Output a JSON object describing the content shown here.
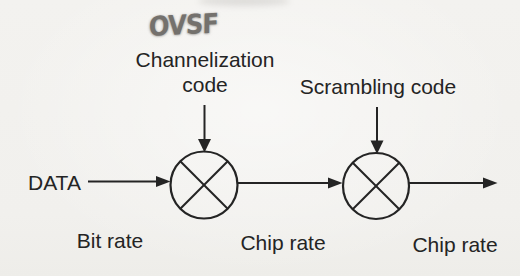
{
  "colors": {
    "paper": "#f2f1ee",
    "ink": "#242424",
    "pencil": "#74716d"
  },
  "annotation": {
    "text": "OVSF"
  },
  "diagram": {
    "channelization": {
      "line1": "Channelization",
      "line2": "code"
    },
    "scrambling": {
      "label": "Scrambling code"
    },
    "input": {
      "label": "DATA"
    },
    "rates": {
      "input": "Bit rate",
      "mid": "Chip rate",
      "output": "Chip rate"
    }
  }
}
